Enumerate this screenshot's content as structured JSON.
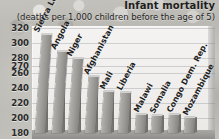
{
  "header": {
    "title": "Infant mortality",
    "subtitle": "(deaths per 1,000 children before the age of 5)"
  },
  "chart_data": {
    "type": "bar",
    "title": "Infant mortality",
    "subtitle": "(deaths per 1,000 children before the age of 5)",
    "xlabel": "",
    "ylabel": "",
    "ylim": [
      180,
      320
    ],
    "grid": true,
    "legend": "none",
    "orientation": "vertical",
    "style": "3d-perspective",
    "y_ticks": [
      320,
      300,
      280,
      270,
      260,
      240,
      220,
      200,
      180
    ],
    "categories": [
      "Sierra Leone",
      "Angola",
      "Niger",
      "Afghanistan",
      "Mali",
      "Liberia",
      "Malawi",
      "Somalia",
      "Congo Dem. Rep.",
      "Mozambique"
    ],
    "values": [
      316,
      292,
      282,
      257,
      237,
      235,
      205,
      204,
      205,
      201
    ],
    "series": [
      {
        "name": "Under-five mortality rate",
        "values": [
          316,
          292,
          282,
          257,
          237,
          235,
          205,
          204,
          205,
          201
        ]
      }
    ]
  },
  "colors": {
    "bar_face": "#9b9a96",
    "bar_side": "#76756f",
    "plot_background": "#f0efed",
    "page_background": "#bdbbb6",
    "text": "#1f1f1f",
    "gridline": "#787d87"
  }
}
